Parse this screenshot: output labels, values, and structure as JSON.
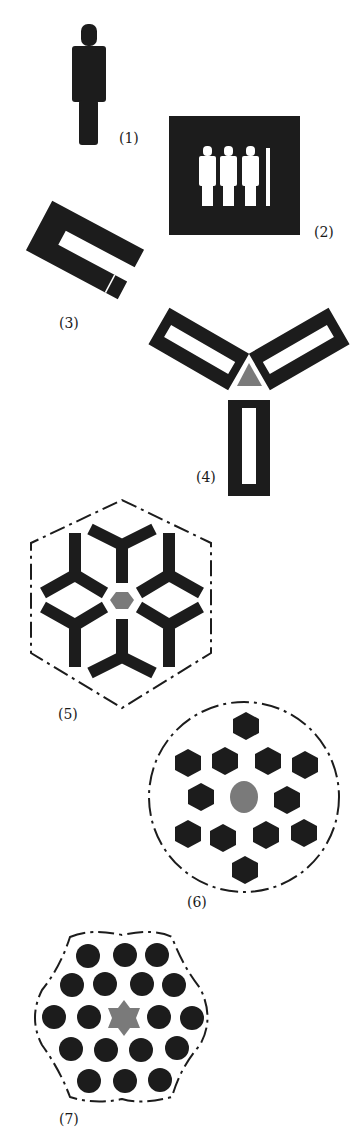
{
  "diagram": {
    "colors": {
      "ink": "#1c1c1c",
      "center_gray": "#7a7a7a",
      "background": "#ffffff"
    },
    "figures": [
      {
        "id": 1,
        "label": "(1)",
        "shape": "single standing person silhouette"
      },
      {
        "id": 2,
        "label": "(2)",
        "shape": "black square with four white person silhouettes (last one partial)"
      },
      {
        "id": 3,
        "label": "(3)",
        "shape": "tilted U-shaped rectangular frame"
      },
      {
        "id": 4,
        "label": "(4)",
        "shape": "three U-frames arranged radially around a gray triangle"
      },
      {
        "id": 5,
        "label": "(5)",
        "shape": "six Y-shapes around gray hexagon inside dash-dot hexagon"
      },
      {
        "id": 6,
        "label": "(6)",
        "shape": "thirteen black hexagons around gray circle inside dash-dot circle"
      },
      {
        "id": 7,
        "label": "(7)",
        "shape": "twenty black circles around gray star inside dash-dot wavy hexagon"
      }
    ]
  }
}
